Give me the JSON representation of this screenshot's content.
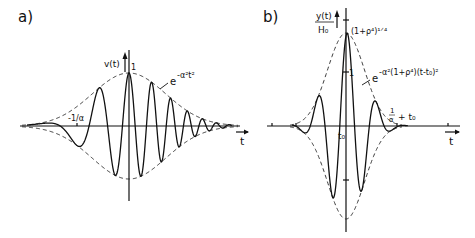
{
  "panel_a": {
    "label": "a)",
    "y_axis_label": "v(t)",
    "peak_label": "1",
    "envelope_label_base": "e",
    "envelope_label_exp": "-α²t²",
    "tick_label": "-1/α",
    "x_axis_label": "t"
  },
  "panel_b": {
    "label": "b)",
    "y_axis_label_num": "y(t)",
    "y_axis_label_den": "H₀",
    "peak_label": "(1+ρ⁴)¹ᐟ⁴",
    "one_label": "1",
    "envelope_label_base": "e",
    "envelope_label_exp": "-α²(1+ρ⁴)(t-t₀)²",
    "t0_label": "t₀",
    "tick_label_num": "1",
    "tick_label_den": "α",
    "tick_label_suffix": "+ t₀",
    "x_axis_label": "t"
  }
}
